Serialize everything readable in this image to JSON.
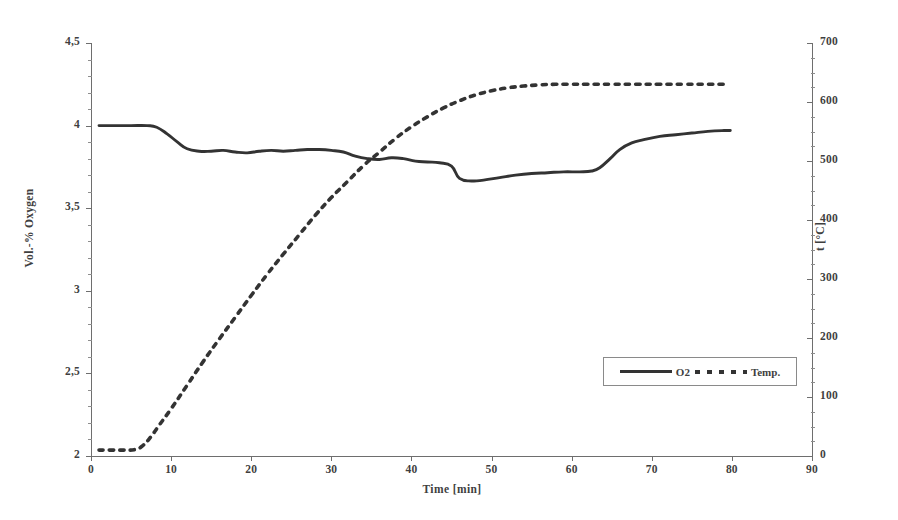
{
  "chart_data": {
    "type": "line",
    "title": "",
    "xlabel": "Time [min]",
    "xlim": [
      0,
      90
    ],
    "xticks": [
      "0",
      "10",
      "20",
      "30",
      "40",
      "50",
      "60",
      "70",
      "80",
      "90"
    ],
    "xtick_values": [
      0,
      10,
      20,
      30,
      40,
      50,
      60,
      70,
      80,
      90
    ],
    "grid": false,
    "legend_position": "lower right",
    "axes": {
      "left": {
        "label": "Vol.-% Oxygen",
        "lim": [
          2,
          4.5
        ],
        "ticks": [
          "2",
          "2,5",
          "3",
          "3,5",
          "4",
          "4,5"
        ],
        "tick_values": [
          2,
          2.5,
          3,
          3.5,
          4,
          4.5
        ]
      },
      "right": {
        "label": "t [°C]",
        "lim": [
          0,
          700
        ],
        "ticks": [
          "0",
          "100",
          "200",
          "300",
          "400",
          "500",
          "600",
          "700"
        ],
        "tick_values": [
          0,
          100,
          200,
          300,
          400,
          500,
          600,
          700
        ]
      }
    },
    "series": [
      {
        "name": "O2",
        "axis": "left",
        "style": "solid",
        "color": "#333333",
        "unit": "Vol.-%",
        "points": [
          [
            1.0,
            4.0
          ],
          [
            3.0,
            4.0
          ],
          [
            5.0,
            4.0
          ],
          [
            7.0,
            4.0
          ],
          [
            8.2,
            3.99
          ],
          [
            9.5,
            3.95
          ],
          [
            10.8,
            3.9
          ],
          [
            12.0,
            3.86
          ],
          [
            13.5,
            3.845
          ],
          [
            15.0,
            3.845
          ],
          [
            16.5,
            3.85
          ],
          [
            18.0,
            3.84
          ],
          [
            19.5,
            3.835
          ],
          [
            21.0,
            3.845
          ],
          [
            22.5,
            3.85
          ],
          [
            24.0,
            3.845
          ],
          [
            25.5,
            3.85
          ],
          [
            27.0,
            3.855
          ],
          [
            28.5,
            3.855
          ],
          [
            30.0,
            3.85
          ],
          [
            31.5,
            3.84
          ],
          [
            33.0,
            3.815
          ],
          [
            34.5,
            3.8
          ],
          [
            36.0,
            3.795
          ],
          [
            37.5,
            3.805
          ],
          [
            39.0,
            3.8
          ],
          [
            40.5,
            3.785
          ],
          [
            42.0,
            3.78
          ],
          [
            43.5,
            3.775
          ],
          [
            45.0,
            3.755
          ],
          [
            46.0,
            3.68
          ],
          [
            47.5,
            3.665
          ],
          [
            49.0,
            3.67
          ],
          [
            51.0,
            3.685
          ],
          [
            53.0,
            3.7
          ],
          [
            55.0,
            3.71
          ],
          [
            57.0,
            3.715
          ],
          [
            59.0,
            3.72
          ],
          [
            61.0,
            3.72
          ],
          [
            62.5,
            3.725
          ],
          [
            63.5,
            3.745
          ],
          [
            64.8,
            3.8
          ],
          [
            66.0,
            3.855
          ],
          [
            67.5,
            3.895
          ],
          [
            69.0,
            3.915
          ],
          [
            71.0,
            3.935
          ],
          [
            73.0,
            3.945
          ],
          [
            75.0,
            3.955
          ],
          [
            77.0,
            3.965
          ],
          [
            79.0,
            3.97
          ],
          [
            79.8,
            3.97
          ]
        ]
      },
      {
        "name": "Temp.",
        "axis": "right",
        "style": "dotted",
        "color": "#333333",
        "unit": "°C",
        "points": [
          [
            1.0,
            10
          ],
          [
            2.5,
            10
          ],
          [
            4.0,
            10
          ],
          [
            5.5,
            11
          ],
          [
            6.5,
            18
          ],
          [
            7.5,
            33
          ],
          [
            8.5,
            52
          ],
          [
            10.0,
            80
          ],
          [
            12.0,
            120
          ],
          [
            14.0,
            160
          ],
          [
            16.0,
            198
          ],
          [
            18.0,
            235
          ],
          [
            20.0,
            272
          ],
          [
            22.0,
            308
          ],
          [
            24.0,
            342
          ],
          [
            26.0,
            375
          ],
          [
            28.0,
            408
          ],
          [
            30.0,
            438
          ],
          [
            32.0,
            465
          ],
          [
            34.0,
            492
          ],
          [
            36.0,
            515
          ],
          [
            38.0,
            538
          ],
          [
            40.0,
            558
          ],
          [
            42.0,
            575
          ],
          [
            44.0,
            590
          ],
          [
            46.0,
            602
          ],
          [
            48.0,
            612
          ],
          [
            50.0,
            619
          ],
          [
            52.0,
            624
          ],
          [
            54.0,
            627
          ],
          [
            56.0,
            629
          ],
          [
            58.0,
            630
          ],
          [
            60.0,
            630
          ],
          [
            62.0,
            630
          ],
          [
            65.0,
            630
          ],
          [
            68.0,
            630
          ],
          [
            71.0,
            630
          ],
          [
            74.0,
            630
          ],
          [
            77.0,
            630
          ],
          [
            79.5,
            630
          ]
        ]
      }
    ],
    "annotations": []
  },
  "legend": {
    "entries": [
      {
        "label": "O2",
        "style": "solid"
      },
      {
        "label": "Temp.",
        "style": "dotted"
      }
    ]
  }
}
